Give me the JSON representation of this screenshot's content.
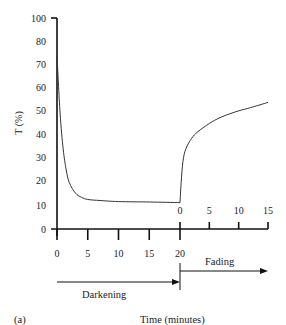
{
  "chart_data": {
    "type": "line",
    "title": "",
    "panel_label": "(a)",
    "xlabel": "Time (minutes)",
    "ylabel": "T (%)",
    "ylim": [
      0,
      100
    ],
    "y_ticks": [
      0,
      10,
      20,
      30,
      40,
      50,
      60,
      70,
      80,
      100
    ],
    "x_ticks_darkening": [
      0,
      5,
      10,
      15,
      20
    ],
    "x_ticks_fading": [
      0,
      5,
      10,
      15
    ],
    "grid": false,
    "legend": null,
    "annotations": [
      "Darkening",
      "Fading"
    ],
    "series": [
      {
        "name": "Darkening",
        "x": [
          0,
          0.5,
          1,
          1.5,
          2,
          3,
          4,
          5,
          7,
          10,
          15,
          20
        ],
        "y": [
          82,
          55,
          38,
          28,
          22,
          17,
          15,
          14,
          13.5,
          13,
          12.8,
          12.5
        ]
      },
      {
        "name": "Fading",
        "x": [
          0,
          0.2,
          0.5,
          1,
          2,
          3,
          5,
          7,
          10,
          12,
          15
        ],
        "y": [
          12.5,
          22,
          32,
          38,
          43,
          46,
          50,
          53,
          56,
          57.5,
          60
        ]
      }
    ]
  },
  "labels": {
    "ylabel": "T (%)",
    "xlabel": "Time (minutes)",
    "panel": "(a)",
    "darkening": "Darkening",
    "fading": "Fading"
  }
}
